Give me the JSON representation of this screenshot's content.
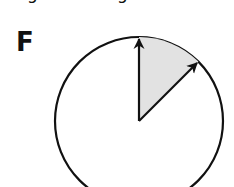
{
  "top_clipped_text": {
    "fragments": [
      "g",
      "g"
    ]
  },
  "panel": {
    "label": "F"
  },
  "figure": {
    "type": "circle-with-shaded-sector",
    "circle": {
      "cx": 139,
      "cy": 121,
      "r": 84,
      "stroke": "#111111",
      "fill": "#ffffff"
    },
    "vectors": [
      {
        "name": "vertical-arrow",
        "angle_deg_from_up": 0
      },
      {
        "name": "diagonal-arrow",
        "angle_deg_from_up": 45
      }
    ],
    "sector": {
      "start_deg": 0,
      "end_deg": 45,
      "fill": "#e2e2e2"
    }
  }
}
